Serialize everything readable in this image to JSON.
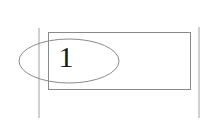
{
  "diagram": {
    "label": "1",
    "colors": {
      "background": "#ffffff",
      "stroke": "#8a8a8a",
      "rule": "#a0a0a0",
      "text": "#1a1a1a"
    },
    "shapes": {
      "left_line": {
        "x": 39,
        "y1": 28,
        "y2": 118
      },
      "right_line": {
        "x": 199,
        "y1": 27,
        "y2": 118
      },
      "rectangle": {
        "x": 48,
        "y": 32,
        "width": 142,
        "height": 57
      },
      "ellipse": {
        "cx": 69,
        "cy": 61,
        "rx": 50,
        "ry": 22
      }
    }
  }
}
